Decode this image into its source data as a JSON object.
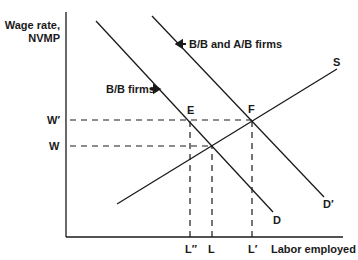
{
  "chart_data": {
    "type": "line",
    "title": "",
    "xlabel": "Labor employed",
    "ylabel": "Wage rate, NVMP",
    "ylabel_lines": [
      "Wage rate,",
      "NVMP"
    ],
    "grid": false,
    "legend": "none",
    "axis_ticks_numeric": false,
    "xlim": [
      0,
      277
    ],
    "ylim": [
      0,
      225
    ],
    "series": [
      {
        "name": "D",
        "label": "D",
        "description": "demand (B/B firms)",
        "style": "solid",
        "points": [
          [
            30,
            216
          ],
          [
            207,
            25
          ]
        ]
      },
      {
        "name": "D′",
        "label": "D′",
        "description": "demand (B/B and A/B firms)",
        "style": "solid",
        "points": [
          [
            86,
            221
          ],
          [
            258,
            40
          ]
        ]
      },
      {
        "name": "S",
        "label": "S",
        "description": "supply",
        "style": "solid",
        "points": [
          [
            51,
            33
          ],
          [
            271,
            168
          ]
        ]
      }
    ],
    "reference_lines": [
      {
        "orientation": "horizontal",
        "label": "W′",
        "value": 117,
        "from": 4,
        "to": 186
      },
      {
        "orientation": "horizontal",
        "label": "W",
        "value": 91,
        "from": 4,
        "to": 146
      },
      {
        "orientation": "vertical",
        "label": "L″",
        "value": 124,
        "from": 0,
        "to": 117
      },
      {
        "orientation": "vertical",
        "label": "L",
        "value": 146,
        "from": 0,
        "to": 91
      },
      {
        "orientation": "vertical",
        "label": "L′",
        "value": 186,
        "from": 0,
        "to": 117
      }
    ],
    "points": [
      {
        "label": "E",
        "x": 124,
        "y": 117,
        "description": "D meets W′"
      },
      {
        "label": "F",
        "x": 186,
        "y": 117,
        "description": "D′ meets S"
      },
      {
        "label": "",
        "x": 146,
        "y": 91,
        "description": "D meets S (equilibrium W, L)"
      }
    ],
    "annotations": [
      {
        "text": "B/B firms",
        "arrow": "right",
        "points_to": "D"
      },
      {
        "text": "B/B and A/B firms",
        "arrow": "left",
        "points_to": "D′"
      }
    ],
    "colors": {
      "line": "#1a1a1a",
      "background": "#ffffff"
    }
  },
  "labels": {
    "ylabel_line1": "Wage rate,",
    "ylabel_line2": "NVMP",
    "xlabel": "Labor employed",
    "w_prime": "W′",
    "w": "W",
    "e": "E",
    "f": "F",
    "s": "S",
    "d": "D",
    "d_prime": "D′",
    "l_double_prime": "L″",
    "l": "L",
    "l_prime": "L′",
    "bb_firms": "B/B firms",
    "bb_ab_firms": "B/B and A/B firms"
  }
}
